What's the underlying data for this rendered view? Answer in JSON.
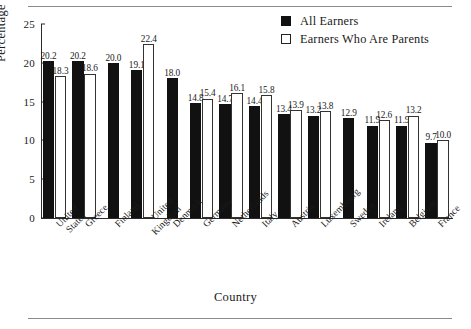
{
  "chart_data": {
    "type": "bar",
    "title": "",
    "xlabel": "Country",
    "ylabel": "Percentage",
    "ylim": [
      0,
      25
    ],
    "yticks": [
      "0",
      "5",
      "10",
      "15",
      "20",
      "25"
    ],
    "grid": false,
    "legend_position": "top-right",
    "categories": [
      "United States",
      "Greece",
      "Finland",
      "United Kingdom",
      "Denmark",
      "Germany",
      "Netherlands",
      "Italy",
      "Austria",
      "Luxembourg",
      "Sweden",
      "Ireland",
      "Belgium",
      "France"
    ],
    "category_lines": [
      [
        "United",
        "States"
      ],
      [
        "Greece"
      ],
      [
        "Finland"
      ],
      [
        "United",
        "Kingdom"
      ],
      [
        "Denmark"
      ],
      [
        "Germany"
      ],
      [
        "Netherlands"
      ],
      [
        "Italy"
      ],
      [
        "Austria"
      ],
      [
        "Luxembourg"
      ],
      [
        "Sweden"
      ],
      [
        "Ireland"
      ],
      [
        "Belgium"
      ],
      [
        "France"
      ]
    ],
    "series": [
      {
        "name": "All Earners",
        "color": "#111111",
        "values": [
          20.2,
          20.2,
          20.0,
          19.1,
          18.0,
          14.8,
          14.7,
          14.4,
          13.4,
          13.2,
          12.9,
          11.9,
          11.9,
          9.7
        ],
        "labels": [
          "20.2",
          "20.2",
          "20.0",
          "19.1",
          "18.0",
          "14.8",
          "14.7",
          "14.4",
          "13.4",
          "13.2",
          "12.9",
          "11.9",
          "11.9",
          "9.7"
        ]
      },
      {
        "name": "Earners Who Are Parents",
        "color": "#ffffff",
        "values": [
          18.3,
          18.6,
          null,
          22.4,
          null,
          15.4,
          16.1,
          15.8,
          13.9,
          13.8,
          null,
          12.6,
          13.2,
          10.0
        ],
        "labels": [
          "18.3",
          "18.6",
          null,
          "22.4",
          null,
          "15.4",
          "16.1",
          "15.8",
          "13.9",
          "13.8",
          null,
          "12.6",
          "13.2",
          "10.0"
        ]
      }
    ]
  },
  "legend": {
    "items": [
      {
        "label": "All Earners",
        "swatch": "filled-square"
      },
      {
        "label": "Earners Who Are Parents",
        "swatch": "open-square"
      }
    ]
  },
  "axes": {
    "y_title": "Percentage",
    "x_title": "Country"
  }
}
